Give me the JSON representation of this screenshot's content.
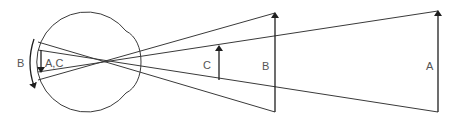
{
  "diagram": {
    "type": "eye-optics-retinal-image-size",
    "labels": {
      "eye_outer_arrow": "B",
      "eye_inner_arrow": "A,C",
      "object_c": "C",
      "object_b": "B",
      "object_a": "A"
    },
    "nodal_point": {
      "x": 112,
      "y": 62
    },
    "objects": [
      {
        "name": "C",
        "x": 219,
        "top": 46,
        "bottom": 80
      },
      {
        "name": "B",
        "x": 275,
        "top": 13,
        "bottom": 112
      },
      {
        "name": "A",
        "x": 438,
        "top": 11,
        "bottom": 112
      }
    ],
    "colors": {
      "line": "#3a3a3a",
      "arrow": "#1f1f1f",
      "label": "#555555"
    }
  }
}
